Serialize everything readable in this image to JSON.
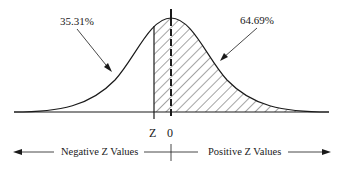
{
  "diagram": {
    "type": "normal-distribution-curve",
    "left_area_label": "35.31%",
    "right_area_label": "64.69%",
    "z_marker_label": "Z",
    "zero_marker_label": "0",
    "negative_label": "Negative Z Values",
    "positive_label": "Positive Z Values",
    "shaded_region": "from Z to right tail (hatched)",
    "colors": {
      "line": "#1a1a1a",
      "background": "#ffffff"
    }
  }
}
